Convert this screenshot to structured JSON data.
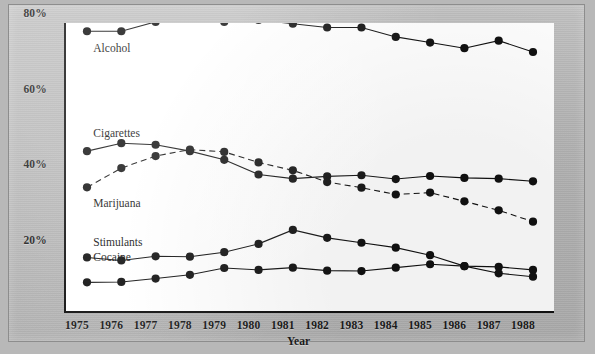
{
  "chart_data": {
    "type": "line",
    "title": "",
    "xlabel": "Year",
    "ylabel": "",
    "x": [
      1975,
      1976,
      1977,
      1978,
      1979,
      1980,
      1981,
      1982,
      1983,
      1984,
      1985,
      1986,
      1987,
      1988
    ],
    "categories": [
      "1975",
      "1976",
      "1977",
      "1978",
      "1979",
      "1980",
      "1981",
      "1982",
      "1983",
      "1984",
      "1985",
      "1986",
      "1987",
      "1988"
    ],
    "xlim": [
      1975,
      1988
    ],
    "ylim": [
      0,
      80
    ],
    "yticks": [
      20,
      40,
      60,
      80
    ],
    "ytick_labels": [
      "20%",
      "40%",
      "60%",
      "80%"
    ],
    "grid": false,
    "legend": "inline-labels",
    "series": [
      {
        "name": "Alcohol",
        "style": "solid",
        "marker": "filled-circle",
        "color": "#111111",
        "label_x": 1975.3,
        "label_y": 63.5,
        "values": [
          68.5,
          68.5,
          71.0,
          72.0,
          71.0,
          71.5,
          70.5,
          69.5,
          69.5,
          67.0,
          65.5,
          64.0,
          66.0,
          63.0
        ]
      },
      {
        "name": "Cigarettes",
        "style": "solid",
        "marker": "filled-circle",
        "color": "#111111",
        "label_x": 1975.3,
        "label_y": 41.0,
        "values": [
          36.7,
          38.8,
          38.4,
          36.7,
          34.4,
          30.5,
          29.4,
          30.0,
          30.3,
          29.3,
          30.1,
          29.6,
          29.4,
          28.7
        ]
      },
      {
        "name": "Marijuana",
        "style": "dashed",
        "marker": "filled-circle",
        "color": "#111111",
        "label_x": 1975.3,
        "label_y": 22.5,
        "values": [
          27.1,
          32.2,
          35.4,
          37.1,
          36.5,
          33.7,
          31.6,
          28.5,
          27.0,
          25.2,
          25.7,
          23.4,
          21.0,
          18.0
        ]
      },
      {
        "name": "Stimulants",
        "style": "solid",
        "marker": "filled-circle",
        "color": "#111111",
        "label_x": 1975.3,
        "label_y": 12.0,
        "values": [
          8.5,
          7.7,
          8.8,
          8.7,
          9.9,
          12.1,
          15.8,
          13.7,
          12.4,
          11.1,
          9.1,
          6.2,
          6.0,
          5.2
        ]
      },
      {
        "name": "Cocaine",
        "style": "solid",
        "marker": "filled-circle",
        "color": "#111111",
        "label_x": 1975.3,
        "label_y": 8.2,
        "values": [
          1.9,
          2.0,
          2.9,
          3.9,
          5.7,
          5.2,
          5.8,
          5.0,
          4.9,
          5.8,
          6.7,
          6.2,
          4.3,
          3.4
        ]
      }
    ]
  },
  "axes": {
    "y_labels": [
      "80%",
      "60%",
      "40%",
      "20%"
    ],
    "x_labels": [
      "1975",
      "1976",
      "1977",
      "1978",
      "1979",
      "1980",
      "1981",
      "1982",
      "1983",
      "1984",
      "1985",
      "1986",
      "1987",
      "1988"
    ],
    "x_title": "Year"
  }
}
